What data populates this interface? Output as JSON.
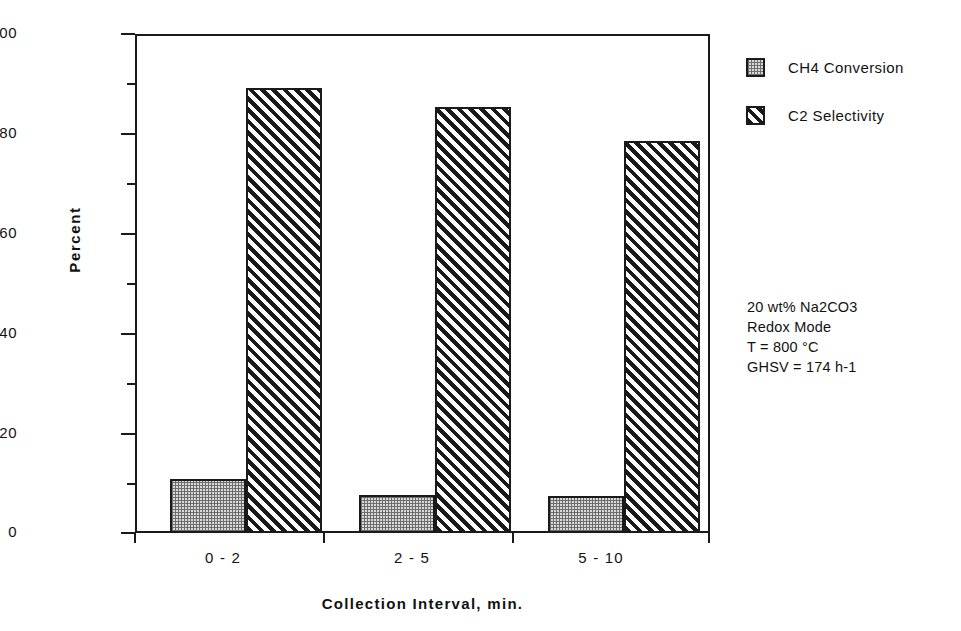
{
  "chart_data": {
    "type": "bar",
    "title": "",
    "categories": [
      "0 - 2",
      "2 - 5",
      "5 - 10"
    ],
    "series": [
      {
        "name": "CH4 Conversion",
        "values": [
          10.8,
          7.7,
          7.4
        ],
        "pattern": "dotted"
      },
      {
        "name": "C2 Selectivity",
        "values": [
          89.1,
          85.4,
          78.5
        ],
        "pattern": "diagonal-hatch"
      }
    ],
    "xlabel": "Collection Interval,  min.",
    "ylabel": "Percent",
    "ylim": [
      0,
      100
    ],
    "ytick_major": [
      0,
      20,
      40,
      60,
      80,
      100
    ],
    "ytick_minor": [
      10,
      30,
      50,
      70,
      90
    ],
    "grid": false,
    "legend_position": "right-top",
    "annotations": [
      "20 wt% Na2CO3",
      "Redox Mode",
      "T = 800 °C",
      "GHSV = 174 h-1"
    ]
  },
  "axis": {
    "y_title": "Percent",
    "x_title": "Collection Interval,  min.",
    "y_labels": {
      "t0": "0",
      "t20": "20",
      "t40": "40",
      "t60": "60",
      "t80": "80",
      "t100": "100"
    },
    "x_labels": {
      "c0": "0 - 2",
      "c1": "2 - 5",
      "c2": "5 - 10"
    }
  },
  "legend": {
    "entries": [
      {
        "label": "CH4 Conversion"
      },
      {
        "label": "C2 Selectivity"
      }
    ]
  },
  "annotation": {
    "line1": "20 wt% Na2CO3",
    "line2": "Redox Mode",
    "line3": "T = 800 °C",
    "line4": "GHSV = 174 h-1"
  },
  "style": {
    "ink": "#1a1a1a",
    "dotted_fill": "#d9d9d9",
    "hatch_fill": "#1a1a1a",
    "background": "#ffffff"
  }
}
